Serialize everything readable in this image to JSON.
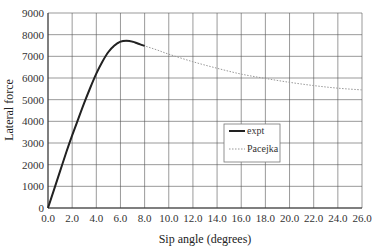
{
  "chart_data": {
    "type": "line",
    "title": "",
    "xlabel": "Sip angle (degrees)",
    "ylabel": "Lateral force",
    "xlim": [
      0,
      26
    ],
    "ylim": [
      0,
      9000
    ],
    "xticks": [
      "0.0",
      "2.0",
      "4.0",
      "6.0",
      "8.0",
      "10.0",
      "12.0",
      "14.0",
      "16.0",
      "18.0",
      "20.0",
      "22.0",
      "24.0",
      "26.0"
    ],
    "yticks": [
      "0",
      "1000",
      "2000",
      "3000",
      "4000",
      "5000",
      "6000",
      "7000",
      "8000",
      "9000"
    ],
    "grid": true,
    "legend_position": "center-right",
    "series": [
      {
        "name": "expt",
        "style": "solid",
        "color": "#222222",
        "x": [
          0,
          0.5,
          1.0,
          1.5,
          2.0,
          2.5,
          3.0,
          3.5,
          4.0,
          4.5,
          5.0,
          5.5,
          6.0,
          6.5,
          7.0,
          7.5,
          8.0
        ],
        "y": [
          0,
          850,
          1700,
          2550,
          3350,
          4100,
          4850,
          5550,
          6200,
          6750,
          7200,
          7500,
          7680,
          7720,
          7680,
          7580,
          7480
        ]
      },
      {
        "name": "Pacejka",
        "style": "dotted",
        "color": "#999999",
        "x": [
          0,
          1,
          2,
          3,
          4,
          5,
          6,
          6.5,
          7,
          8,
          9,
          10,
          12,
          14,
          16,
          18,
          20,
          22,
          24,
          26
        ],
        "y": [
          0,
          1700,
          3350,
          4850,
          6200,
          7200,
          7650,
          7700,
          7650,
          7480,
          7300,
          7100,
          6750,
          6450,
          6180,
          5980,
          5800,
          5650,
          5530,
          5450
        ]
      }
    ]
  },
  "legend": {
    "items": [
      {
        "label": "expt"
      },
      {
        "label": "Pacejka"
      }
    ]
  },
  "colors": {
    "grid": "#555555",
    "expt": "#222222",
    "pacejka": "#999999",
    "background": "#ffffff"
  }
}
